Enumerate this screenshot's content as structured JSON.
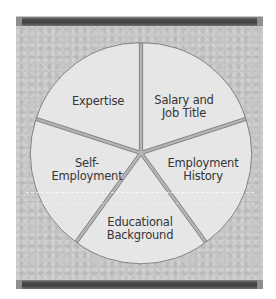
{
  "chart_data": {
    "type": "pie",
    "title": "",
    "categories": [
      "Expertise",
      "Salary and Job Title",
      "Employment History",
      "Educational Background",
      "Self-Employment"
    ],
    "values": [
      20,
      20,
      20,
      20,
      20
    ],
    "slices": [
      {
        "label": "Expertise",
        "text": "Expertise"
      },
      {
        "label": "Salary and Job Title",
        "text": "Salary and\nJob Title"
      },
      {
        "label": "Employment History",
        "text": "Employment\nHistory"
      },
      {
        "label": "Educational Background",
        "text": "Educational\nBackground"
      },
      {
        "label": "Self-Employment",
        "text": "Self-\nEmployment"
      }
    ],
    "legend": "none",
    "exploded": true
  },
  "colors": {
    "panel": "#c3c3c3",
    "bar": "#454545",
    "slice_fill": "#e6e6e6",
    "slice_outline": "#7a7a7a",
    "gap": "#b5b5b5",
    "text": "#353535"
  }
}
